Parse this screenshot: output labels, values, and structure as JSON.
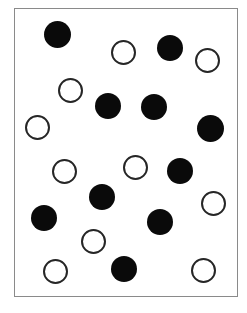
{
  "figure": {
    "title": "",
    "width": 247,
    "height": 313,
    "background_color": "#ffffff"
  },
  "frame": {
    "name": "plot-frame",
    "x": 14,
    "y": 8,
    "width": 224,
    "height": 289,
    "border_color": "#8a8a8a",
    "border_width": 1,
    "fill_color": "#ffffff"
  },
  "legend": {
    "filled_label": "filled circle",
    "open_label": "open circle"
  },
  "chart_data": {
    "type": "scatter",
    "title": "",
    "xlabel": "",
    "ylabel": "",
    "xlim": [
      14,
      238
    ],
    "ylim": [
      8,
      297
    ],
    "grid": false,
    "legend_position": "none",
    "counts": {
      "filled": 11,
      "open": 10,
      "total": 21
    },
    "colors": {
      "filled": "#0a0a0a",
      "open_stroke": "#262626",
      "open_fill": "#ffffff",
      "frame": "#8a8a8a",
      "background": "#ffffff"
    },
    "marker": {
      "filled_diameter": 26,
      "open_diameter": 25,
      "open_stroke_width": 2
    },
    "series": [
      {
        "name": "filled",
        "style": "filled",
        "points": [
          {
            "cx": 57,
            "cy": 34,
            "d": 27
          },
          {
            "cx": 170,
            "cy": 48,
            "d": 26
          },
          {
            "cx": 108,
            "cy": 106,
            "d": 26
          },
          {
            "cx": 154,
            "cy": 107,
            "d": 26
          },
          {
            "cx": 210,
            "cy": 128,
            "d": 27
          },
          {
            "cx": 180,
            "cy": 171,
            "d": 26
          },
          {
            "cx": 102,
            "cy": 197,
            "d": 26
          },
          {
            "cx": 44,
            "cy": 218,
            "d": 26
          },
          {
            "cx": 160,
            "cy": 222,
            "d": 26
          },
          {
            "cx": 124,
            "cy": 269,
            "d": 26
          }
        ]
      },
      {
        "name": "open",
        "style": "open",
        "points": [
          {
            "cx": 123,
            "cy": 52,
            "d": 25
          },
          {
            "cx": 207,
            "cy": 60,
            "d": 25
          },
          {
            "cx": 70,
            "cy": 90,
            "d": 25
          },
          {
            "cx": 37,
            "cy": 127,
            "d": 25
          },
          {
            "cx": 135,
            "cy": 167,
            "d": 25
          },
          {
            "cx": 64,
            "cy": 171,
            "d": 25
          },
          {
            "cx": 213,
            "cy": 203,
            "d": 25
          },
          {
            "cx": 93,
            "cy": 241,
            "d": 25
          },
          {
            "cx": 55,
            "cy": 271,
            "d": 25
          },
          {
            "cx": 203,
            "cy": 270,
            "d": 25
          }
        ]
      }
    ]
  }
}
